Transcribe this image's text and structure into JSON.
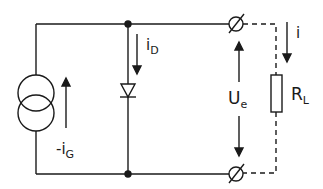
{
  "diagram": {
    "type": "circuit-schematic",
    "stroke_color": "#1a1a1a",
    "components": {
      "current_source": {
        "label_main": "-i",
        "label_sub": "G"
      },
      "diode": {
        "label_main": "i",
        "label_sub": "D"
      },
      "output_voltage": {
        "label_main": "U",
        "label_sub": "e"
      },
      "load_resistor": {
        "label_main": "R",
        "label_sub": "L",
        "connection": "dashed"
      },
      "load_current": {
        "label_main": "i"
      }
    }
  }
}
